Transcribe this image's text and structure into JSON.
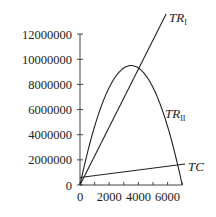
{
  "chart_data": {
    "type": "line",
    "title": "",
    "xlabel": "",
    "ylabel": "",
    "xlim": [
      0,
      7000
    ],
    "ylim": [
      0,
      12000000
    ],
    "grid": false,
    "x_ticks": [
      0,
      1000,
      2000,
      3000,
      4000,
      5000,
      6000,
      7000
    ],
    "x_tick_labels": [
      "0",
      "2000",
      "4000",
      "6000"
    ],
    "x_tick_label_values": [
      0,
      2000,
      4000,
      6000
    ],
    "y_ticks": [
      0,
      2000000,
      4000000,
      6000000,
      8000000,
      10000000,
      12000000
    ],
    "y_tick_labels": [
      "0",
      "2 000 000",
      "4 000 000",
      "6 000 000",
      "8 000 000",
      "10 000 000",
      "12 000 000"
    ],
    "series": [
      {
        "name": "TR_I",
        "label": "TR",
        "subscript": "I",
        "kind": "linear",
        "x": [
          0,
          5900
        ],
        "values": [
          0,
          13600000
        ]
      },
      {
        "name": "TR_II",
        "label": "TR",
        "subscript": "II",
        "kind": "quadratic",
        "x": [
          0,
          1000,
          2000,
          3000,
          3500,
          4000,
          5000,
          6000,
          7000
        ],
        "values": [
          0,
          4650000,
          7760000,
          9330000,
          9500000,
          9330000,
          7760000,
          4650000,
          0
        ]
      },
      {
        "name": "TC",
        "label": "TC",
        "subscript": "",
        "kind": "linear",
        "x": [
          0,
          7200
        ],
        "values": [
          600000,
          1670000
        ]
      }
    ]
  }
}
